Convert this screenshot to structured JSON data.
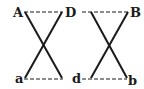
{
  "diagram": {
    "labels": {
      "A": "A",
      "D": "D",
      "B": "B",
      "a": "a",
      "d": "d",
      "b": "b"
    },
    "left_cross": {
      "top_left": "A",
      "top_right": "D",
      "bottom_left": "a",
      "bottom_right": "d",
      "dashed_edges": [
        "A-D",
        "a-d"
      ],
      "solid_edges": [
        "A-d",
        "D-a"
      ]
    },
    "right_cross": {
      "top_left": "D",
      "top_right": "B",
      "bottom_left": "d",
      "bottom_right": "b",
      "dashed_edges": [
        "D-B",
        "d-b"
      ],
      "solid_edges": [
        "D-b",
        "B-d"
      ]
    },
    "colors": {
      "line": "#1a1a1a",
      "background": "#ffffff"
    }
  }
}
